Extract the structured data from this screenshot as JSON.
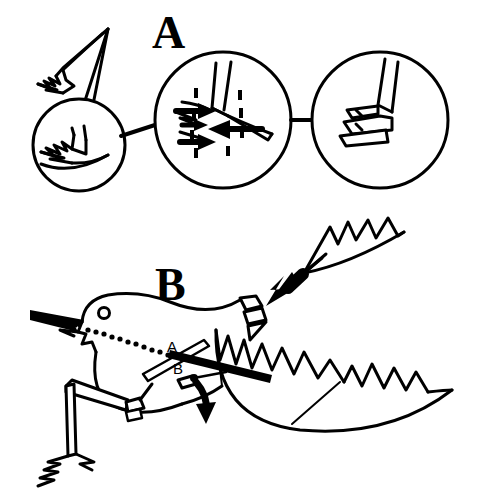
{
  "figure": {
    "background_color": "#ffffff",
    "ink_color": "#000000",
    "width": 484,
    "height": 497,
    "panels": [
      {
        "id": "panel-a",
        "letter": "A",
        "letter_x": 152,
        "letter_y": 48,
        "description": "Feather with three magnifier circles showing progressive detail of barb/barbule interlocking",
        "circles": [
          {
            "id": "circle-1",
            "cx": 79,
            "cy": 145,
            "r": 46,
            "content": "barbs-unzipped"
          },
          {
            "id": "circle-2",
            "cx": 223,
            "cy": 120,
            "r": 68,
            "content": "barbule-arrows"
          },
          {
            "id": "circle-3",
            "cx": 380,
            "cy": 120,
            "r": 68,
            "content": "hooklets-locked"
          }
        ],
        "connectors": [
          {
            "id": "connector-1-2",
            "x1": 121,
            "x2": 157,
            "y1": 134,
            "y2": 124
          },
          {
            "id": "connector-2-3",
            "x1": 291,
            "x2": 312,
            "y1": 120,
            "y2": 120
          }
        ],
        "arrow_count_right": 3,
        "arrow_count_left": 1,
        "barbule_dash_count": 6
      },
      {
        "id": "panel-b",
        "letter": "B",
        "letter_x": 155,
        "letter_y": 300,
        "description": "Bird holding a feather, preening; labelled structures A and B with motion arrows",
        "labels": [
          {
            "id": "label-a",
            "text": "A",
            "x": 175,
            "y": 348,
            "refers_to": "rachis-rod"
          },
          {
            "id": "label-b",
            "text": "B",
            "x": 177,
            "y": 373,
            "refers_to": "pivot-hook"
          }
        ],
        "motion_arrows": [
          {
            "id": "beak-arrow",
            "direction": "left",
            "style": "solid-black"
          },
          {
            "id": "feather-arrow",
            "direction": "down-left",
            "style": "solid-black-thick"
          },
          {
            "id": "pivot-arrow",
            "direction": "down",
            "style": "curved-black"
          }
        ],
        "bird_parts": [
          "head",
          "eye",
          "beak",
          "body",
          "leg",
          "foot",
          "wing",
          "tail"
        ],
        "dotted_guide": {
          "id": "beak-tongue-dotted-line",
          "dot_count": 14
        }
      }
    ]
  }
}
